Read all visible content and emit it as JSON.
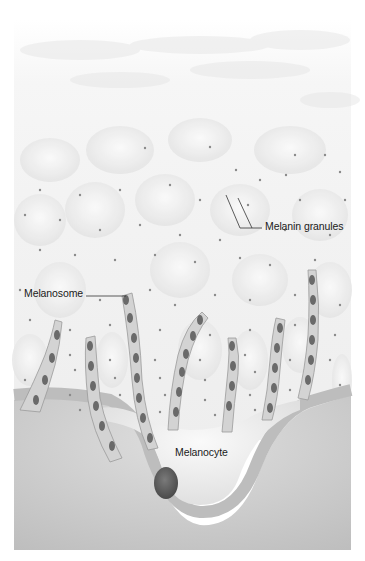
{
  "figure": {
    "style": "grayscale illustration",
    "colors": {
      "background": "#ffffff",
      "epidermis": "#f4f4f4",
      "cell_shadow": "#e4e4e4",
      "granule_dot": "#8a8a8a",
      "dendrite_fill": "#cfcfcf",
      "dendrite_outline": "#9a9a9a",
      "melanosome": "#6a6a6a",
      "basement_band": "#bdbdbd",
      "dermis": "#d6d6d6",
      "melanocyte_body": "#f2f2f2",
      "nucleus": "#5a5a5a",
      "label_text": "#1a1a1a",
      "leader_line": "#333333"
    }
  },
  "labels": {
    "melanin_granules": "Melanin granules",
    "melanosome": "Melanosome",
    "melanocyte": "Melanocyte"
  }
}
